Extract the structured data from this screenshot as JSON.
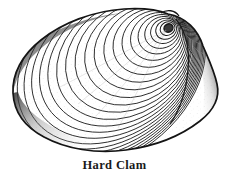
{
  "figure": {
    "caption": "Hard Clam",
    "style": "black-and-white line engraving",
    "background_color": "#ffffff",
    "ink_color": "#1b1b1b",
    "shading_color": "#4a4a4a",
    "stipple_color": "#9a9a9a",
    "illustration": {
      "umbo": {
        "cx": 168,
        "cy": 28,
        "label": "umbo-beak"
      },
      "growth_rings_count": 26,
      "outline_extents": {
        "left_x": 13,
        "right_x": 219,
        "top_y": 8,
        "bottom_y": 151
      }
    }
  }
}
